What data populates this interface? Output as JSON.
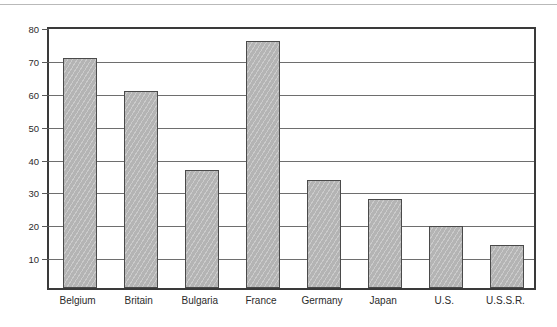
{
  "chart_data": {
    "type": "bar",
    "title": "",
    "subtitle": "",
    "xlabel": "",
    "ylabel": "Percent",
    "categories": [
      "Belgium",
      "Britain",
      "Bulgaria",
      "France",
      "Germany",
      "Japan",
      "U.S.",
      "U.S.S.R."
    ],
    "values": [
      70,
      60,
      36,
      75,
      33,
      27,
      19,
      13
    ],
    "series": [
      {
        "name": "Percent",
        "values": [
          70,
          60,
          36,
          75,
          33,
          27,
          19,
          13
        ]
      }
    ],
    "ylim": [
      0,
      80
    ],
    "yticks": [
      10,
      20,
      30,
      40,
      50,
      60,
      70,
      80
    ],
    "ytick_labels": [
      "10",
      "20",
      "30",
      "40",
      "50",
      "60",
      "70",
      "80"
    ],
    "grid": "horizontal",
    "legend": "none",
    "bar_fill_color": "#b4b4b4",
    "bar_edge_color": "#4a4a4a",
    "frame_color": "#3a3a3a",
    "gridline_color": "#6e6e6e",
    "text_color": "#2b2b2b",
    "annotations": []
  }
}
